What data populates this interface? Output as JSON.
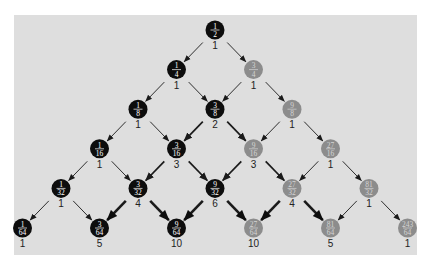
{
  "diagram": {
    "type": "probability-tree",
    "panel_color": "#dedede",
    "colors": {
      "black_node": "#0d0d0d",
      "gray_node": "#8c8c8c",
      "black_text": "#ffffff",
      "gray_text": "#d4d4d4",
      "edge": "#1a1a1a"
    },
    "rows": [
      [
        {
          "num": "1",
          "den": "2",
          "count": "1",
          "color": "black"
        }
      ],
      [
        {
          "num": "1",
          "den": "4",
          "count": "1",
          "color": "black"
        },
        {
          "num": "3",
          "den": "4",
          "count": "1",
          "color": "gray"
        }
      ],
      [
        {
          "num": "1",
          "den": "8",
          "count": "1",
          "color": "black"
        },
        {
          "num": "3",
          "den": "8",
          "count": "2",
          "color": "black"
        },
        {
          "num": "9",
          "den": "8",
          "count": "1",
          "color": "gray"
        }
      ],
      [
        {
          "num": "1",
          "den": "16",
          "count": "1",
          "color": "black"
        },
        {
          "num": "3",
          "den": "16",
          "count": "3",
          "color": "black"
        },
        {
          "num": "9",
          "den": "16",
          "count": "3",
          "color": "gray"
        },
        {
          "num": "27",
          "den": "16",
          "count": "1",
          "color": "gray"
        }
      ],
      [
        {
          "num": "1",
          "den": "32",
          "count": "1",
          "color": "black"
        },
        {
          "num": "3",
          "den": "32",
          "count": "4",
          "color": "black"
        },
        {
          "num": "9",
          "den": "32",
          "count": "6",
          "color": "black"
        },
        {
          "num": "27",
          "den": "32",
          "count": "4",
          "color": "gray"
        },
        {
          "num": "81",
          "den": "32",
          "count": "1",
          "color": "gray"
        }
      ],
      [
        {
          "num": "1",
          "den": "64",
          "count": "1",
          "color": "black"
        },
        {
          "num": "3",
          "den": "64",
          "count": "5",
          "color": "black"
        },
        {
          "num": "9",
          "den": "64",
          "count": "10",
          "color": "black"
        },
        {
          "num": "27",
          "den": "64",
          "count": "10",
          "color": "gray"
        },
        {
          "num": "81",
          "den": "64",
          "count": "5",
          "color": "gray"
        },
        {
          "num": "243",
          "den": "64",
          "count": "1",
          "color": "gray"
        }
      ]
    ]
  }
}
